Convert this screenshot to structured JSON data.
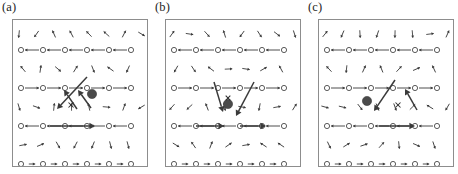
{
  "figure": {
    "type": "vector-field-lattice-diagram",
    "background_color": "#ffffff",
    "frame_color": "#8d8d8d",
    "ink_color": "#3a3a3a",
    "marker_color": "#4a4a4a",
    "width": 458,
    "height": 174,
    "panel_count": 3
  },
  "panels": [
    {
      "id": "a",
      "label": "(a)",
      "origin_x": 0,
      "frame": {
        "x": 12,
        "y": 19,
        "width": 136,
        "height": 148
      },
      "lattice": {
        "circle_rows_y": [
          30,
          68,
          106,
          144
        ],
        "circle_cols_x": [
          8,
          30,
          52,
          74,
          96,
          118,
          134
        ],
        "circle_radius": 2.6,
        "arrow_rows_y": [
          14,
          49,
          87,
          125
        ],
        "description": "alternating rows of open circles with short horizontal arrows and rows of small tilted arrows"
      },
      "filled_circle": {
        "cx": 79,
        "cy": 74,
        "r": 4.6
      },
      "cross_marker": {
        "cx": 58,
        "cy": 85,
        "size": 5.0
      },
      "bold_arrows": [
        {
          "x1": 74,
          "y1": 57,
          "x2": 44,
          "y2": 89,
          "label": "down-left-long"
        },
        {
          "x1": 64,
          "y1": 89,
          "x2": 51,
          "y2": 70,
          "label": "up-left-short"
        },
        {
          "x1": 78,
          "y1": 88,
          "x2": 65,
          "y2": 70,
          "label": "up-left-to-circle"
        },
        {
          "x1": 37,
          "y1": 106,
          "x2": 82,
          "y2": 106,
          "label": "right-horizontal-long"
        }
      ]
    },
    {
      "id": "b",
      "label": "(b)",
      "origin_x": 153,
      "frame": {
        "x": 12,
        "y": 19,
        "width": 136,
        "height": 148
      },
      "lattice": {
        "circle_rows_y": [
          30,
          68,
          106,
          144
        ],
        "circle_cols_x": [
          8,
          30,
          52,
          74,
          96,
          118,
          134
        ],
        "circle_radius": 2.6,
        "arrow_rows_y": [
          14,
          49,
          87,
          125
        ],
        "description": "same lattice as panel a with symmetric V-shaped bold arrow pair"
      },
      "filled_circle": {
        "cx": 62,
        "cy": 84,
        "r": 4.6
      },
      "cross_marker": {
        "cx": 62,
        "cy": 78,
        "size": 4.6
      },
      "bold_arrows": [
        {
          "x1": 48,
          "y1": 62,
          "x2": 57,
          "y2": 92,
          "label": "down-right-into-circle"
        },
        {
          "x1": 88,
          "y1": 62,
          "x2": 70,
          "y2": 96,
          "label": "up-right-from-circle"
        },
        {
          "x1": 30,
          "y1": 106,
          "x2": 58,
          "y2": 106,
          "label": "right-horizontal-left"
        },
        {
          "x1": 74,
          "y1": 106,
          "x2": 100,
          "y2": 106,
          "label": "right-horizontal-right"
        }
      ]
    },
    {
      "id": "c",
      "label": "(c)",
      "origin_x": 306,
      "frame": {
        "x": 12,
        "y": 19,
        "width": 136,
        "height": 148
      },
      "lattice": {
        "circle_rows_y": [
          30,
          68,
          106,
          144
        ],
        "circle_cols_x": [
          8,
          30,
          52,
          74,
          96,
          118,
          134
        ],
        "circle_radius": 2.6,
        "arrow_rows_y": [
          14,
          49,
          87,
          125
        ],
        "description": "mirror image of panel a; filled circle sits left of the cross marker"
      },
      "filled_circle": {
        "cx": 48,
        "cy": 81,
        "r": 4.6
      },
      "cross_marker": {
        "cx": 79,
        "cy": 85,
        "size": 5.0
      },
      "bold_arrows": [
        {
          "x1": 76,
          "y1": 60,
          "x2": 55,
          "y2": 91,
          "label": "down-left-to-circle"
        },
        {
          "x1": 98,
          "y1": 90,
          "x2": 86,
          "y2": 69,
          "label": "up-right-short"
        },
        {
          "x1": 60,
          "y1": 106,
          "x2": 96,
          "y2": 106,
          "label": "right-horizontal-long"
        }
      ]
    }
  ]
}
